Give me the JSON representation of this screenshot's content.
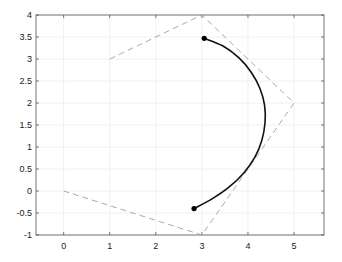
{
  "chart_data": {
    "type": "line",
    "title": "",
    "xlabel": "",
    "ylabel": "",
    "xlim": [
      -0.6,
      5.65
    ],
    "ylim": [
      -1,
      4
    ],
    "grid": true,
    "legend": null,
    "xticks": [
      0,
      1,
      2,
      3,
      4,
      5
    ],
    "xtick_labels": [
      "0",
      "1",
      "2",
      "3",
      "4",
      "5"
    ],
    "yticks": [
      -1,
      -0.5,
      0,
      0.5,
      1,
      1.5,
      2,
      2.5,
      3,
      3.5,
      4
    ],
    "ytick_labels": [
      "-1",
      "-0.5",
      "0",
      "0.5",
      "1",
      "1.5",
      "2",
      "2.5",
      "3",
      "3.5",
      "4"
    ],
    "series": [
      {
        "name": "control-polygon",
        "style": "dashed",
        "color": "#aaaaaa",
        "x": [
          1,
          3,
          5,
          3,
          0
        ],
        "y": [
          3,
          4,
          2,
          -1,
          0
        ]
      },
      {
        "name": "arc",
        "style": "solid",
        "color": "#111111",
        "x": [
          3.05,
          3.45,
          3.8,
          4.07,
          4.26,
          4.36,
          4.37,
          4.3,
          4.15,
          3.9,
          3.58,
          3.22,
          2.83
        ],
        "y": [
          3.47,
          3.3,
          3.03,
          2.7,
          2.33,
          1.95,
          1.55,
          1.15,
          0.77,
          0.4,
          0.08,
          -0.18,
          -0.4
        ]
      },
      {
        "name": "endpoints",
        "style": "markers",
        "color": "#000000",
        "x": [
          3.05,
          2.83
        ],
        "y": [
          3.47,
          -0.4
        ]
      }
    ]
  }
}
